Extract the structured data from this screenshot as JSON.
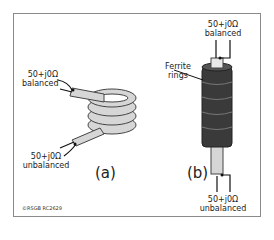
{
  "figure": {
    "part_a": {
      "caption": "(a)",
      "top_label": {
        "line1": "50+j0Ω",
        "line2": "balanced"
      },
      "bottom_label": {
        "line1": "50+j0Ω",
        "line2": "unbalanced"
      }
    },
    "part_b": {
      "caption": "(b)",
      "ferrite_label": {
        "line1": "Ferrite",
        "line2": "rings"
      },
      "top_label": {
        "line1": "50+j0Ω",
        "line2": "balanced"
      },
      "bottom_label": {
        "line1": "50+j0Ω",
        "line2": "unbalanced"
      }
    },
    "copyright": "©RSGB RC2629",
    "colors": {
      "coax": "#d6d6d6",
      "ferrite": "#3a3a3a",
      "frame": "#8a8a8a"
    }
  }
}
